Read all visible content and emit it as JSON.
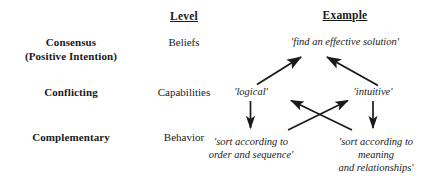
{
  "diagram": {
    "ink_color": "#1a1a1a",
    "background_color": "#ffffff",
    "columns": [
      {
        "id": "category",
        "header": ""
      },
      {
        "id": "level",
        "header": "Level"
      },
      {
        "id": "example",
        "header": "Example"
      }
    ],
    "headers": {
      "level": "Level",
      "example": "Example"
    },
    "rows": [
      {
        "id": "consensus",
        "category_line1": "Consensus",
        "category_line2": "(Positive Intention)",
        "level": "Beliefs",
        "examples": [
          "'find an effective solution'"
        ]
      },
      {
        "id": "conflicting",
        "category_line1": "Conflicting",
        "category_line2": "",
        "level": "Capabilities",
        "examples": [
          "'logical'",
          "'intuitive'"
        ]
      },
      {
        "id": "complementary",
        "category_line1": "Complementary",
        "category_line2": "",
        "level": "Behavior",
        "examples": [
          "'sort according to\norder and sequence'",
          "'sort according to\nmeaning\nand relationships'"
        ]
      }
    ],
    "cells": {
      "consensus_label_line1": "Consensus",
      "consensus_label_line2": "(Positive Intention)",
      "consensus_level": "Beliefs",
      "consensus_example": "'find an effective solution'",
      "conflicting_label": "Conflicting",
      "conflicting_level": "Capabilities",
      "conflicting_example_left": "'logical'",
      "conflicting_example_right": "'intuitive'",
      "complementary_label": "Complementary",
      "complementary_level": "Behavior",
      "complementary_example_left_line1": "'sort according to",
      "complementary_example_left_line2": "order and sequence'",
      "complementary_example_right_line1": "'sort according to",
      "complementary_example_right_line2": "meaning",
      "complementary_example_right_line3": "and relationships'"
    },
    "arrows": [
      {
        "id": "logical-to-solution",
        "from": "'logical'",
        "to": "'find an effective solution'",
        "direction": "up-right"
      },
      {
        "id": "intuitive-to-solution",
        "from": "'intuitive'",
        "to": "'find an effective solution'",
        "direction": "up-left"
      },
      {
        "id": "logical-to-order-sequence",
        "from": "'logical'",
        "to": "'sort according to order and sequence'",
        "direction": "down"
      },
      {
        "id": "intuitive-to-meaning-relationships",
        "from": "'intuitive'",
        "to": "'sort according to meaning and relationships'",
        "direction": "down"
      },
      {
        "id": "order-sequence-to-intuitive",
        "from": "'sort according to order and sequence'",
        "to": "'intuitive'",
        "direction": "up-right-cross"
      },
      {
        "id": "meaning-relationships-to-logical",
        "from": "'sort according to meaning and relationships'",
        "to": "'logical'",
        "direction": "up-left-cross"
      }
    ]
  }
}
